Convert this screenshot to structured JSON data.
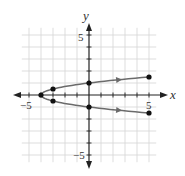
{
  "chart_data": {
    "type": "line",
    "title": "",
    "xlabel": "x",
    "ylabel": "y",
    "xlim": [
      -5.5,
      5.5
    ],
    "ylim": [
      -5.5,
      5.5
    ],
    "grid": true,
    "tick_labels": {
      "x": [
        "-5",
        "5"
      ],
      "y": [
        "5",
        "-5"
      ]
    },
    "series": [
      {
        "name": "upper branch",
        "direction": "increasing x",
        "points": [
          [
            -4,
            0
          ],
          [
            -3,
            0.5
          ],
          [
            0,
            1
          ],
          [
            5,
            1.5
          ]
        ]
      },
      {
        "name": "lower branch",
        "direction": "decreasing x",
        "points": [
          [
            5,
            -1.5
          ],
          [
            0,
            -1
          ],
          [
            -3,
            -0.5
          ],
          [
            -4,
            0
          ]
        ]
      }
    ],
    "marked_points": [
      [
        -4,
        0
      ],
      [
        -3,
        0.5
      ],
      [
        -3,
        -0.5
      ],
      [
        0,
        1
      ],
      [
        0,
        -1
      ],
      [
        5,
        1.5
      ],
      [
        5,
        -1.5
      ]
    ],
    "curve_color": "#6b6b6b",
    "grid_color": "#d4d4d4",
    "axis_color": "#222222"
  },
  "labels": {
    "x_axis": "x",
    "y_axis": "y",
    "x_neg5": "−5",
    "x_pos5": "5",
    "y_pos5": "5",
    "y_neg5": "−5"
  }
}
